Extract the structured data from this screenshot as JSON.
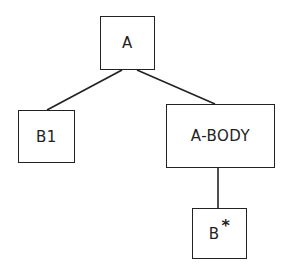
{
  "diagram": {
    "type": "tree",
    "nodes": [
      {
        "id": "A",
        "label": "A",
        "suffix": "",
        "box": {
          "x": 100,
          "y": 16,
          "w": 55,
          "h": 54
        }
      },
      {
        "id": "B1",
        "label": "B1",
        "suffix": "",
        "box": {
          "x": 18,
          "y": 110,
          "w": 57,
          "h": 53
        }
      },
      {
        "id": "A-BODY",
        "label": "A-BODY",
        "suffix": "",
        "box": {
          "x": 166,
          "y": 104,
          "w": 109,
          "h": 64
        }
      },
      {
        "id": "Bstar",
        "label": "B",
        "suffix": "*",
        "box": {
          "x": 192,
          "y": 208,
          "w": 55,
          "h": 51
        }
      }
    ],
    "edges": [
      {
        "from": "A",
        "to": "B1",
        "x1": 122,
        "y1": 70,
        "x2": 47,
        "y2": 110
      },
      {
        "from": "A",
        "to": "A-BODY",
        "x1": 137,
        "y1": 70,
        "x2": 215,
        "y2": 104
      },
      {
        "from": "A-BODY",
        "to": "Bstar",
        "x1": 218,
        "y1": 168,
        "x2": 218,
        "y2": 208
      }
    ],
    "colors": {
      "stroke": "#222222",
      "background": "#ffffff"
    }
  }
}
